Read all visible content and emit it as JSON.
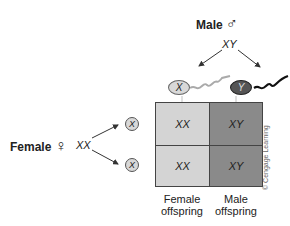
{
  "male": {
    "label": "Male",
    "symbol": "♂",
    "genotype": "XY"
  },
  "female": {
    "label": "Female",
    "symbol": "♀",
    "genotype": "XX"
  },
  "sperm": [
    {
      "chromosome": "X",
      "color": "#d8d8d8"
    },
    {
      "chromosome": "Y",
      "color": "#555555"
    }
  ],
  "eggs": [
    {
      "chromosome": "X"
    },
    {
      "chromosome": "X"
    }
  ],
  "grid": {
    "cells": [
      [
        "XX",
        "XY"
      ],
      [
        "XX",
        "XY"
      ]
    ],
    "colors": {
      "female_col": "#d4d4d4",
      "male_col": "#8a8a8a",
      "border": "#444444"
    }
  },
  "columns": [
    {
      "label_1": "Female",
      "label_2": "offspring"
    },
    {
      "label_1": "Male",
      "label_2": "offspring"
    }
  ],
  "credit": "© Cengage Learning"
}
